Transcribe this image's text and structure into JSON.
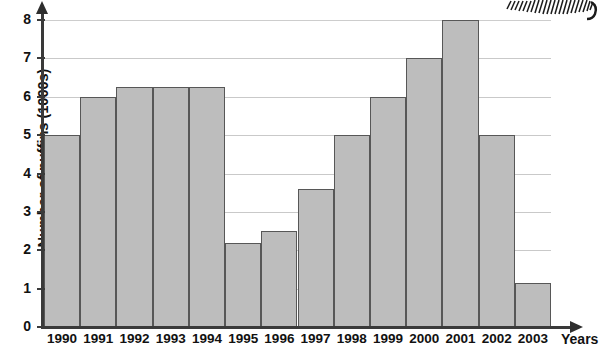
{
  "chart_data": {
    "type": "bar",
    "title": "",
    "xlabel": "Years",
    "ylabel": "Number of puffins (1000s)",
    "categories": [
      "1990",
      "1991",
      "1992",
      "1993",
      "1994",
      "1995",
      "1996",
      "1997",
      "1998",
      "1999",
      "2000",
      "2001",
      "2002",
      "2003"
    ],
    "values": [
      5,
      6,
      6.25,
      6.25,
      6.25,
      2.2,
      2.5,
      3.6,
      5,
      6,
      7,
      8,
      5,
      1.15
    ],
    "ylim": [
      0,
      8
    ],
    "yticks": [
      0,
      1,
      2,
      3,
      4,
      5,
      6,
      7,
      8
    ],
    "ytick_labels": [
      "0",
      "1",
      "2",
      "3",
      "4",
      "5",
      "6",
      "7",
      "8"
    ],
    "grid": true,
    "legend": false,
    "bar_fill_color": "#bdbdbd",
    "bar_edge_color": "#575757",
    "axis_color": "#3a3a3a",
    "gridline_color": "#c9c9c9"
  },
  "axes": {
    "x_title": "Years",
    "y_title": "Number of puffins (1000s)"
  }
}
